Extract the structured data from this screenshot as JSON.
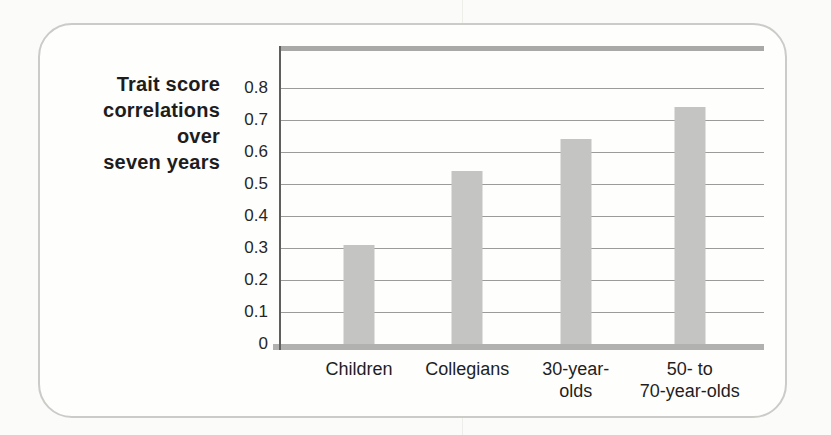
{
  "chart_data": {
    "type": "bar",
    "title": "",
    "ylabel": "Trait score\ncorrelations over\nseven years",
    "xlabel": "",
    "categories": [
      "Children",
      "Collegians",
      "30-year-\nolds",
      "50- to\n70-year-olds"
    ],
    "values": [
      0.31,
      0.54,
      0.64,
      0.74
    ],
    "ytick_labels": [
      "0",
      "0.1",
      "0.2",
      "0.3",
      "0.4",
      "0.5",
      "0.6",
      "0.7",
      "0.8"
    ],
    "yticks": [
      0,
      0.1,
      0.2,
      0.3,
      0.4,
      0.5,
      0.6,
      0.7,
      0.8
    ],
    "ylim": [
      0,
      0.92
    ],
    "grid": true,
    "legend": "none",
    "colors": {
      "bar": "#c4c4c2",
      "gridline": "#9b9b99",
      "axis_line": "#5f5f5d",
      "plot_band": "#adadab",
      "card_border": "#cbcbc8",
      "text": "#1d1d1d"
    }
  }
}
